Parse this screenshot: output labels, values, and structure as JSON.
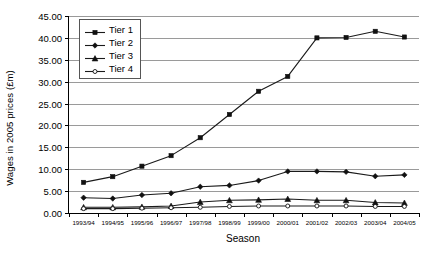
{
  "chart_data": {
    "type": "line",
    "title": "",
    "xlabel": "Season",
    "ylabel": "Wages in 2005 prices (£m)",
    "categories": [
      "1993/94",
      "1994/95",
      "1995/96",
      "1996/97",
      "1997/98",
      "1998/99",
      "1999/00",
      "2000/01",
      "2001/02",
      "2002/03",
      "2003/04",
      "2004/05"
    ],
    "ylim": [
      0,
      45
    ],
    "ytick_step": 5,
    "ytick_labels": [
      "0.00",
      "5.00",
      "10.00",
      "15.00",
      "20.00",
      "25.00",
      "30.00",
      "35.00",
      "40.00",
      "45.00"
    ],
    "grid": true,
    "legend_position": "top-left-inside",
    "series": [
      {
        "name": "Tier 1",
        "marker": "square-filled",
        "color": "#1a1a1a",
        "values": [
          7.0,
          8.3,
          10.7,
          13.1,
          17.2,
          22.5,
          27.8,
          31.2,
          40.0,
          40.1,
          41.5,
          40.2
        ]
      },
      {
        "name": "Tier 2",
        "marker": "diamond-filled",
        "color": "#1a1a1a",
        "values": [
          3.5,
          3.3,
          4.1,
          4.5,
          6.0,
          6.3,
          7.4,
          9.5,
          9.5,
          9.4,
          8.4,
          8.7
        ]
      },
      {
        "name": "Tier 3",
        "marker": "triangle-filled",
        "color": "#1a1a1a",
        "values": [
          1.3,
          1.3,
          1.4,
          1.6,
          2.5,
          2.9,
          3.0,
          3.2,
          2.9,
          2.9,
          2.4,
          2.3
        ]
      },
      {
        "name": "Tier 4",
        "marker": "circle-open",
        "color": "#1a1a1a",
        "values": [
          1.0,
          1.0,
          1.1,
          1.2,
          1.3,
          1.5,
          1.6,
          1.6,
          1.6,
          1.6,
          1.5,
          1.5
        ]
      }
    ]
  },
  "axes": {
    "y_title": "Wages in 2005 prices (£m)",
    "x_title": "Season"
  },
  "legend": {
    "entries": [
      {
        "label": "Tier 1",
        "icon": "legend-marker-square-icon"
      },
      {
        "label": "Tier 2",
        "icon": "legend-marker-diamond-icon"
      },
      {
        "label": "Tier 3",
        "icon": "legend-marker-triangle-icon"
      },
      {
        "label": "Tier 4",
        "icon": "legend-marker-circle-icon"
      }
    ]
  }
}
